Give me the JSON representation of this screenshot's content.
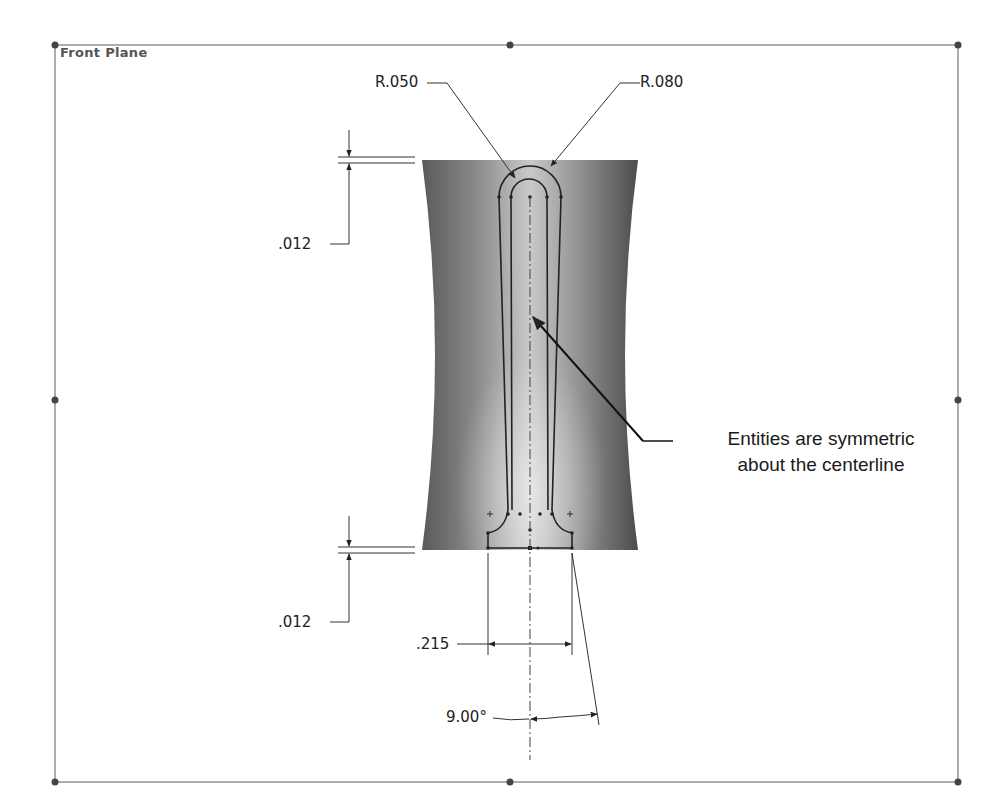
{
  "plane": {
    "label": "Front Plane"
  },
  "dimensions": {
    "radius_inner": "R.050",
    "radius_outer": "R.080",
    "top_offset": ".012",
    "bottom_offset": ".012",
    "base_width": ".215",
    "angle": "9.00°"
  },
  "annotation": {
    "line1": "Entities are symmetric",
    "line2": "about the centerline"
  },
  "colors": {
    "frame": "#777777",
    "handle": "#444444",
    "part_dark": "#555555",
    "part_light": "#d8d8d8",
    "sketch": "#222222",
    "dimension": "#333333"
  }
}
